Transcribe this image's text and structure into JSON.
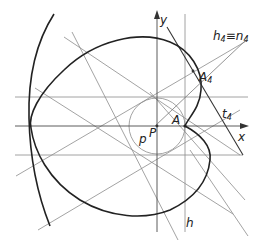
{
  "diagram": {
    "type": "geometric construction",
    "labels": {
      "y_axis": "y",
      "x_axis": "x",
      "h4_n4_base": "h",
      "h4_n4_sub1": "4",
      "h4_n4_eq": "≡",
      "h4_n4_base2": "n",
      "h4_n4_sub2": "4",
      "A4_base": "A",
      "A4_sub": "4",
      "t4_base": "t",
      "t4_sub": "4",
      "A": "A",
      "P": "P",
      "p": "p",
      "h": "h"
    },
    "colors": {
      "curve": "#2a2a2a",
      "thin_line": "#8a8a8a",
      "axis": "#555555",
      "background": "#ffffff"
    }
  }
}
